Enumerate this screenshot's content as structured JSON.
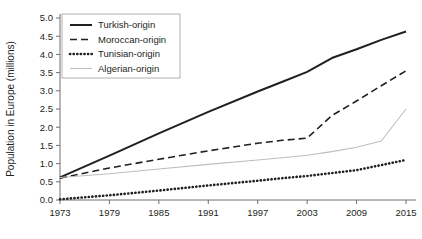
{
  "chart_data": {
    "type": "line",
    "title": "",
    "xlabel": "",
    "ylabel": "Population in Europe (millions)",
    "xlim": [
      1973,
      2015
    ],
    "ylim": [
      0.0,
      5.0
    ],
    "grid": false,
    "legend_position": "top-left",
    "xticks": [
      "1973",
      "1979",
      "1985",
      "1991",
      "1997",
      "2003",
      "2009",
      "2015"
    ],
    "xtick_values": [
      1973,
      1979,
      1985,
      1991,
      1997,
      2003,
      2009,
      2015
    ],
    "yticks": [
      "0.0",
      "0.5",
      "1.0",
      "1.5",
      "2.0",
      "2.5",
      "3.0",
      "3.5",
      "4.0",
      "4.5",
      "5.0"
    ],
    "ytick_values": [
      0.0,
      0.5,
      1.0,
      1.5,
      2.0,
      2.5,
      3.0,
      3.5,
      4.0,
      4.5,
      5.0
    ],
    "x": [
      1973,
      1979,
      1985,
      1991,
      1997,
      2000,
      2003,
      2006,
      2009,
      2012,
      2015
    ],
    "series": [
      {
        "name": "Turkish-origin",
        "style": "solid-thick",
        "color": "#231f20",
        "values": [
          0.62,
          1.22,
          1.83,
          2.42,
          2.98,
          3.25,
          3.52,
          3.9,
          4.14,
          4.4,
          4.63
        ]
      },
      {
        "name": "Moroccan-origin",
        "style": "dashed",
        "color": "#231f20",
        "values": [
          0.6,
          0.88,
          1.12,
          1.35,
          1.56,
          1.64,
          1.7,
          2.32,
          2.72,
          3.14,
          3.55
        ]
      },
      {
        "name": "Tunisian-origin",
        "style": "dotted-thick",
        "color": "#231f20",
        "values": [
          0.02,
          0.13,
          0.26,
          0.4,
          0.53,
          0.6,
          0.66,
          0.74,
          0.82,
          0.96,
          1.1
        ]
      },
      {
        "name": "Algerian-origin",
        "style": "solid-thin",
        "color": "#bcbec0",
        "values": [
          0.62,
          0.72,
          0.85,
          0.98,
          1.1,
          1.16,
          1.23,
          1.33,
          1.45,
          1.62,
          2.5
        ]
      }
    ]
  },
  "legend": {
    "entries": [
      {
        "label": "Turkish-origin",
        "swatch": "solid-thick-line-swatch"
      },
      {
        "label": "Moroccan-origin",
        "swatch": "dashed-line-swatch"
      },
      {
        "label": "Tunisian-origin",
        "swatch": "dotted-line-swatch"
      },
      {
        "label": "Algerian-origin",
        "swatch": "thin-gray-line-swatch"
      }
    ]
  }
}
